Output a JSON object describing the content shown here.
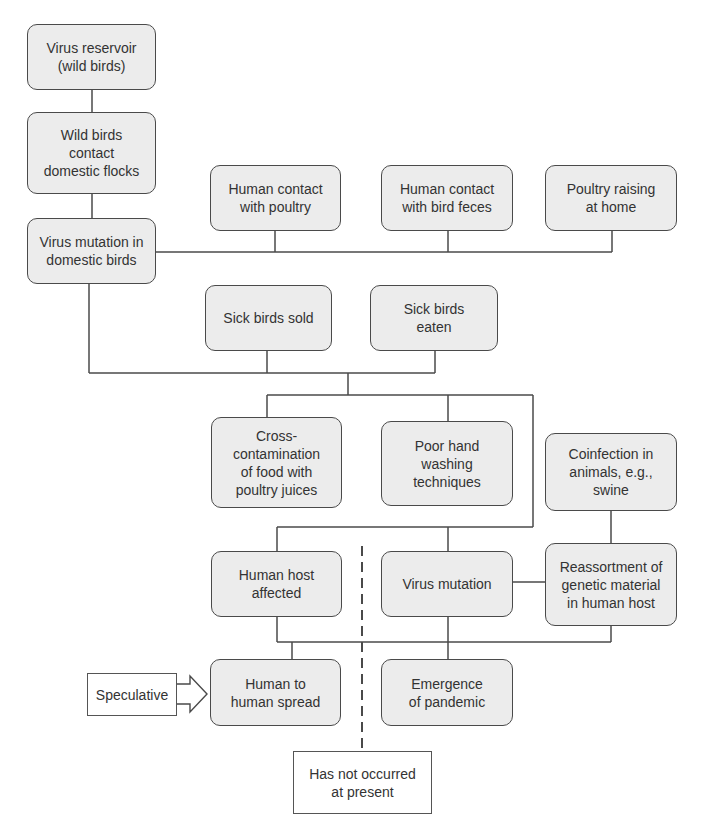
{
  "diagram": {
    "nodes": {
      "reservoir": "Virus reservoir\n(wild birds)",
      "wild_contact": "Wild birds\ncontact\ndomestic flocks",
      "mutation_domestic": "Virus mutation in\ndomestic birds",
      "contact_poultry": "Human contact\nwith poultry",
      "contact_feces": "Human contact\nwith bird feces",
      "poultry_home": "Poultry raising\nat home",
      "sick_sold": "Sick birds sold",
      "sick_eaten": "Sick birds\neaten",
      "cross_contamination": "Cross-\ncontamination\nof food with\npoultry juices",
      "hand_washing": "Poor hand\nwashing\ntechniques",
      "coinfection": "Coinfection in\nanimals, e.g.,\nswine",
      "human_host": "Human host\naffected",
      "virus_mutation": "Virus mutation",
      "reassortment": "Reassortment of\ngenetic material\nin human host",
      "human_spread": "Human to\nhuman spread",
      "pandemic": "Emergence\nof pandemic"
    },
    "annotations": {
      "speculative": "Speculative",
      "not_occurred": "Has not occurred\nat present"
    },
    "colors": {
      "box_fill": "#ececec",
      "box_border": "#4a4a4a",
      "line": "#4a4a4a",
      "text": "#333333"
    }
  }
}
